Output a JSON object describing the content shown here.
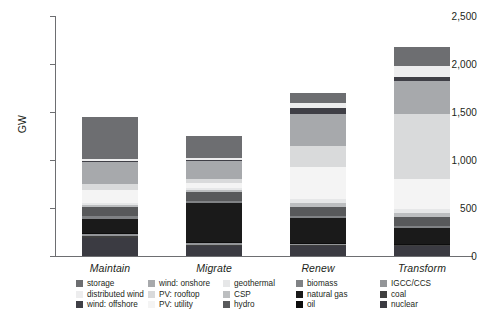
{
  "chart_data": {
    "type": "bar",
    "stacked": true,
    "title": "",
    "xlabel": "",
    "ylabel": "GW",
    "ylim": [
      0,
      2500
    ],
    "yticks": [
      0,
      500,
      1000,
      1500,
      2000,
      2500
    ],
    "ytick_labels": [
      "0",
      "500",
      "1,000",
      "1,500",
      "2,000",
      "2,500"
    ],
    "grid": false,
    "legend_position": "bottom",
    "categories": [
      "Maintain",
      "Migrate",
      "Renew",
      "Transform"
    ],
    "totals": [
      1450,
      1255,
      1700,
      2180
    ],
    "series": [
      {
        "name": "nuclear",
        "color": "#3b3b42",
        "values": [
          185,
          100,
          100,
          100
        ]
      },
      {
        "name": "coal",
        "color": "#404040",
        "values": [
          20,
          18,
          12,
          10
        ]
      },
      {
        "name": "IGCC/CCS",
        "color": "#939598",
        "values": [
          20,
          18,
          12,
          10
        ]
      },
      {
        "name": "oil",
        "color": "#0d0d0d",
        "values": [
          12,
          10,
          8,
          6
        ]
      },
      {
        "name": "natural gas",
        "color": "#1a1a1a",
        "values": [
          150,
          402,
          260,
          170
        ]
      },
      {
        "name": "biomass",
        "color": "#808285",
        "values": [
          28,
          25,
          22,
          20
        ]
      },
      {
        "name": "hydro",
        "color": "#58595b",
        "values": [
          95,
          95,
          95,
          95
        ]
      },
      {
        "name": "CSP",
        "color": "#bcbec0",
        "values": [
          22,
          22,
          45,
          42
        ]
      },
      {
        "name": "geothermal",
        "color": "#e6e7e8",
        "values": [
          18,
          18,
          40,
          35
        ]
      },
      {
        "name": "PV: utility",
        "color": "#f4f4f4",
        "values": [
          138,
          50,
          330,
          320
        ]
      },
      {
        "name": "PV: rooftop",
        "color": "#d9dadb",
        "values": [
          60,
          40,
          220,
          670
        ]
      },
      {
        "name": "wind: onshore",
        "color": "#a7a9ac",
        "values": [
          235,
          195,
          340,
          350
        ]
      },
      {
        "name": "wind: offshore",
        "color": "#3f3f46",
        "values": [
          12,
          12,
          58,
          42
        ]
      },
      {
        "name": "distributed wind",
        "color": "#ededee",
        "values": [
          20,
          18,
          55,
          110
        ]
      },
      {
        "name": "storage",
        "color": "#6d6e71",
        "values": [
          435,
          232,
          103,
          200
        ]
      }
    ]
  },
  "legend": {
    "columns": [
      {
        "items": [
          {
            "label": "storage",
            "color": "#6d6e71"
          },
          {
            "label": "distributed wind",
            "color": "#ededee"
          },
          {
            "label": "wind: offshore",
            "color": "#3f3f46"
          }
        ]
      },
      {
        "items": [
          {
            "label": "wind: onshore",
            "color": "#a7a9ac"
          },
          {
            "label": "PV: rooftop",
            "color": "#d9dadb"
          },
          {
            "label": "PV: utility",
            "color": "#f4f4f4"
          }
        ]
      },
      {
        "items": [
          {
            "label": "geothermal",
            "color": "#e6e7e8"
          },
          {
            "label": "CSP",
            "color": "#bcbec0"
          },
          {
            "label": "hydro",
            "color": "#58595b"
          }
        ]
      },
      {
        "items": [
          {
            "label": "biomass",
            "color": "#808285"
          },
          {
            "label": "natural gas",
            "color": "#1a1a1a"
          },
          {
            "label": "oil",
            "color": "#0d0d0d"
          }
        ]
      },
      {
        "items": [
          {
            "label": "IGCC/CCS",
            "color": "#939598"
          },
          {
            "label": "coal",
            "color": "#404040"
          },
          {
            "label": "nuclear",
            "color": "#3b3b42"
          }
        ]
      }
    ]
  }
}
